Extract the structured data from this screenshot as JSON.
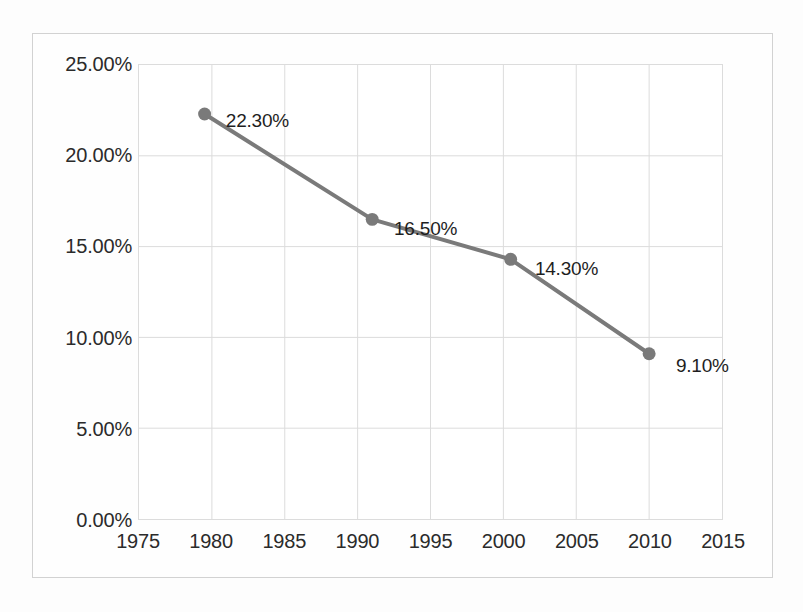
{
  "chart_data": {
    "type": "line",
    "title": "",
    "subtitle": "",
    "xlabel": "",
    "ylabel": "",
    "x": [
      1979.5,
      1991.0,
      2000.5,
      2010.0
    ],
    "values": [
      22.3,
      16.5,
      14.3,
      9.1
    ],
    "point_labels": [
      "22.30%",
      "16.50%",
      "14.30%",
      "9.10%"
    ],
    "xlim": [
      1975,
      2015
    ],
    "ylim": [
      0,
      25
    ],
    "x_ticks": [
      1975,
      1980,
      1985,
      1990,
      1995,
      2000,
      2005,
      2010,
      2015
    ],
    "x_tick_labels": [
      "1975",
      "1980",
      "1985",
      "1990",
      "1995",
      "2000",
      "2005",
      "2010",
      "2015"
    ],
    "y_ticks": [
      0,
      5,
      10,
      15,
      20,
      25
    ],
    "y_tick_labels": [
      "0.00%",
      "5.00%",
      "10.00%",
      "15.00%",
      "20.00%",
      "25.00%"
    ],
    "grid": true,
    "legend": "none",
    "series_color": "#7a7a7a",
    "marker": "circle",
    "marker_color": "#7a7a7a",
    "grid_color": "#dcdcdc",
    "frame_color": "#d2d2d2",
    "label_color": "#1e1e1e"
  }
}
